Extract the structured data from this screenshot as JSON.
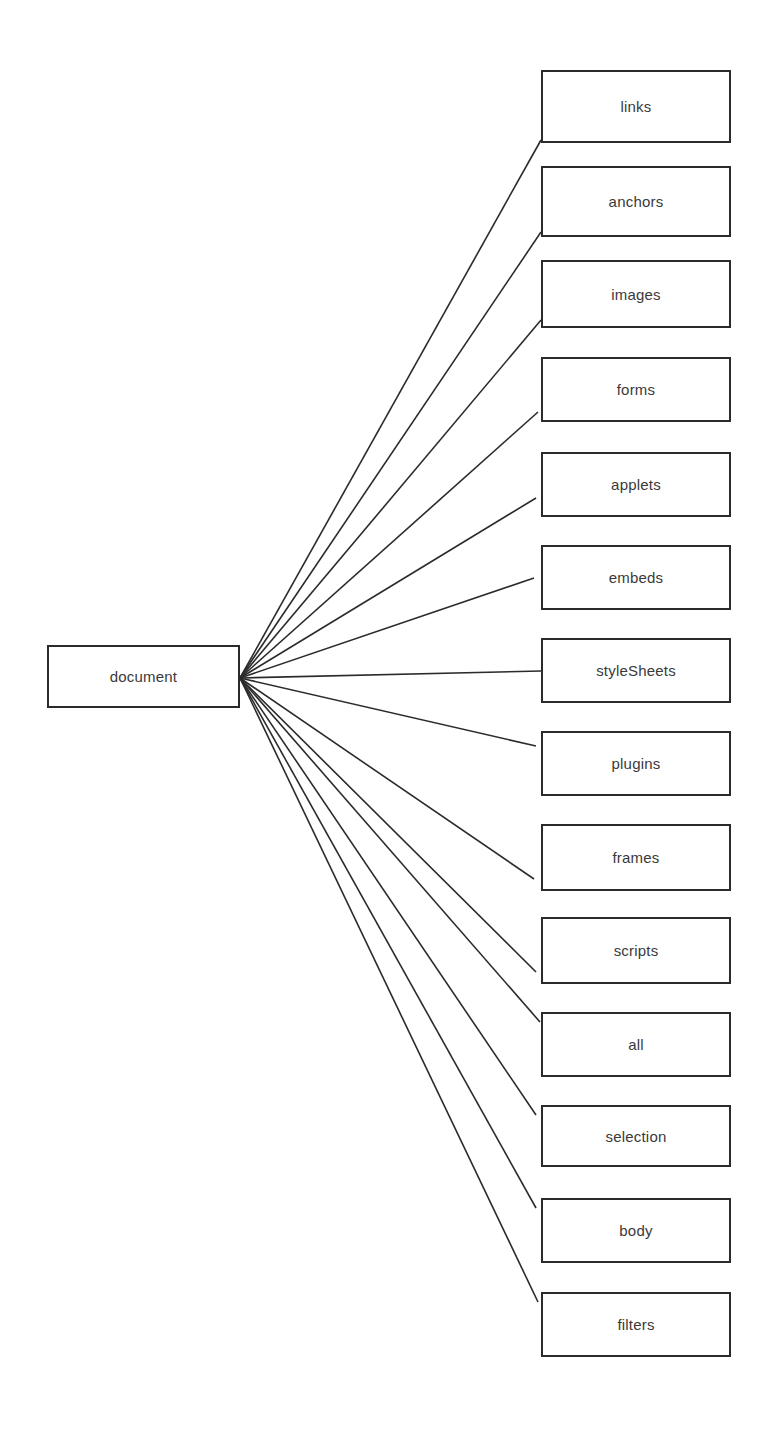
{
  "diagram": {
    "type": "fan-out-tree",
    "background_color": "#ffffff",
    "box_border_color": "#2b2b2b",
    "box_fill_color": "#ffffff",
    "edge_color": "#2b2b2b",
    "text_color": "#3a3a3a",
    "root": {
      "label": "document",
      "x": 47,
      "y": 645,
      "width": 193,
      "height": 63
    },
    "fan_origin": {
      "x": 240,
      "y": 678
    },
    "children": [
      {
        "label": "links",
        "x": 541,
        "y": 70,
        "width": 190,
        "height": 73,
        "anchor_x": 541,
        "anchor_y": 140
      },
      {
        "label": "anchors",
        "x": 541,
        "y": 166,
        "width": 190,
        "height": 71,
        "anchor_x": 541,
        "anchor_y": 232
      },
      {
        "label": "images",
        "x": 541,
        "y": 260,
        "width": 190,
        "height": 68,
        "anchor_x": 541,
        "anchor_y": 320
      },
      {
        "label": "forms",
        "x": 541,
        "y": 357,
        "width": 190,
        "height": 65,
        "anchor_x": 538,
        "anchor_y": 412
      },
      {
        "label": "applets",
        "x": 541,
        "y": 452,
        "width": 190,
        "height": 65,
        "anchor_x": 536,
        "anchor_y": 498
      },
      {
        "label": "embeds",
        "x": 541,
        "y": 545,
        "width": 190,
        "height": 65,
        "anchor_x": 534,
        "anchor_y": 578
      },
      {
        "label": "styleSheets",
        "x": 541,
        "y": 638,
        "width": 190,
        "height": 65,
        "anchor_x": 541,
        "anchor_y": 671
      },
      {
        "label": "plugins",
        "x": 541,
        "y": 731,
        "width": 190,
        "height": 65,
        "anchor_x": 536,
        "anchor_y": 746
      },
      {
        "label": "frames",
        "x": 541,
        "y": 824,
        "width": 190,
        "height": 67,
        "anchor_x": 534,
        "anchor_y": 879
      },
      {
        "label": "scripts",
        "x": 541,
        "y": 917,
        "width": 190,
        "height": 67,
        "anchor_x": 536,
        "anchor_y": 972
      },
      {
        "label": "all",
        "x": 541,
        "y": 1012,
        "width": 190,
        "height": 65,
        "anchor_x": 540,
        "anchor_y": 1022
      },
      {
        "label": "selection",
        "x": 541,
        "y": 1105,
        "width": 190,
        "height": 62,
        "anchor_x": 536,
        "anchor_y": 1115
      },
      {
        "label": "body",
        "x": 541,
        "y": 1198,
        "width": 190,
        "height": 65,
        "anchor_x": 536,
        "anchor_y": 1208
      },
      {
        "label": "filters",
        "x": 541,
        "y": 1292,
        "width": 190,
        "height": 65,
        "anchor_x": 538,
        "anchor_y": 1302
      }
    ]
  }
}
